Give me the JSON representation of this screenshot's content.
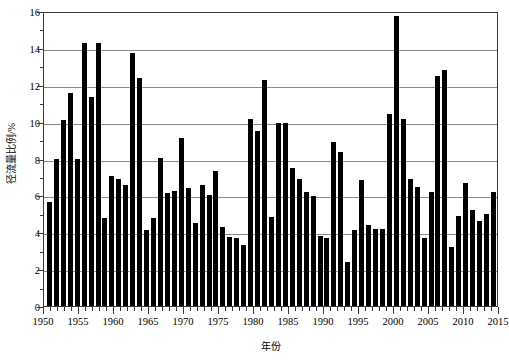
{
  "chart_data": {
    "type": "bar",
    "title": "",
    "xlabel": "年份",
    "ylabel": "径流量比例/%",
    "ylim": [
      0,
      16
    ],
    "ytick_step": 2,
    "yticks": [
      0,
      2,
      4,
      6,
      8,
      10,
      12,
      14,
      16
    ],
    "ytick_labels": [
      "0",
      "2",
      "4",
      "6",
      "8",
      "10",
      "12",
      "14",
      "16"
    ],
    "xlim": [
      1950,
      2015
    ],
    "xticks": [
      1950,
      1955,
      1960,
      1965,
      1970,
      1975,
      1980,
      1985,
      1990,
      1995,
      2000,
      2005,
      2010,
      2015
    ],
    "xtick_labels": [
      "1950",
      "1955",
      "1960",
      "1965",
      "1970",
      "1975",
      "1980",
      "1985",
      "1990",
      "1995",
      "2000",
      "2005",
      "2010",
      "2015"
    ],
    "grid": "horizontal",
    "legend": "none",
    "bar_color": "#000000",
    "categories": [
      "1951",
      "1952",
      "1953",
      "1954",
      "1955",
      "1956",
      "1957",
      "1958",
      "1959",
      "1960",
      "1961",
      "1962",
      "1963",
      "1964",
      "1965",
      "1966",
      "1967",
      "1968",
      "1969",
      "1970",
      "1971",
      "1972",
      "1973",
      "1974",
      "1975",
      "1976",
      "1977",
      "1978",
      "1979",
      "1980",
      "1981",
      "1982",
      "1983",
      "1984",
      "1985",
      "1986",
      "1987",
      "1988",
      "1989",
      "1990",
      "1991",
      "1992",
      "1993",
      "1994",
      "1995",
      "1996",
      "1997",
      "1998",
      "1999",
      "2000",
      "2001",
      "2002",
      "2003",
      "2004",
      "2005",
      "2006",
      "2007",
      "2008",
      "2009",
      "2010",
      "2011",
      "2012",
      "2013",
      "2014",
      "2015"
    ],
    "values": [
      5.65,
      7.95,
      10.1,
      11.55,
      8.0,
      14.25,
      11.35,
      14.25,
      4.8,
      7.05,
      6.9,
      6.55,
      13.7,
      12.35,
      4.1,
      4.75,
      8.05,
      6.15,
      6.25,
      9.1,
      6.4,
      4.5,
      6.55,
      6.0,
      7.3,
      4.3,
      3.75,
      3.7,
      3.3,
      10.15,
      9.5,
      12.25,
      4.85,
      9.95,
      9.9,
      7.5,
      6.9,
      6.2,
      5.95,
      3.8,
      3.7,
      8.9,
      8.35,
      2.4,
      4.1,
      6.85,
      4.4,
      4.15,
      4.2,
      10.4,
      15.75,
      10.15,
      6.9,
      6.45,
      3.7,
      6.2,
      12.5,
      12.8,
      3.2,
      4.9,
      6.65,
      5.2,
      4.6,
      5.0,
      6.2
    ],
    "series": [
      {
        "name": "径流量比例/%",
        "values": [
          5.65,
          7.95,
          10.1,
          11.55,
          8.0,
          14.25,
          11.35,
          14.25,
          4.8,
          7.05,
          6.9,
          6.55,
          13.7,
          12.35,
          4.1,
          4.75,
          8.05,
          6.15,
          6.25,
          9.1,
          6.4,
          4.5,
          6.55,
          6.0,
          7.3,
          4.3,
          3.75,
          3.7,
          3.3,
          10.15,
          9.5,
          12.25,
          4.85,
          9.95,
          9.9,
          7.5,
          6.9,
          6.2,
          5.95,
          3.8,
          3.7,
          8.9,
          8.35,
          2.4,
          4.1,
          6.85,
          4.4,
          4.15,
          4.2,
          10.4,
          15.75,
          10.15,
          6.9,
          6.45,
          3.7,
          6.2,
          12.5,
          12.8,
          3.2,
          4.9,
          6.65,
          5.2,
          4.6,
          5.0,
          6.2
        ]
      }
    ]
  }
}
